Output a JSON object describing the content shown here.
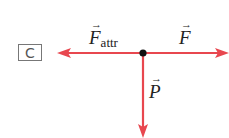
{
  "panel_label": "C",
  "vectors": {
    "f_attr": {
      "symbol": "F",
      "subscript": "attr",
      "arrow": "→"
    },
    "f": {
      "symbol": "F",
      "arrow": "→"
    },
    "p": {
      "symbol": "P",
      "arrow": "→"
    }
  },
  "colors": {
    "arrow": "#e8474f",
    "point": "#111111"
  }
}
